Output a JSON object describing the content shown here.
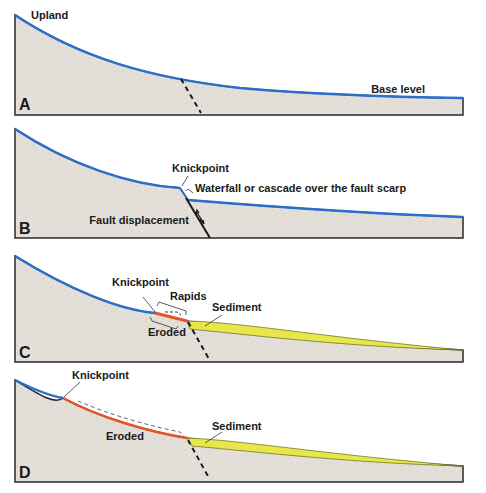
{
  "diagram": {
    "colors": {
      "ground": "#e4dfd9",
      "stream": "#2b6fc9",
      "eroded": "#e2552a",
      "sediment": "#e9e64a",
      "outline": "#2a2a2a"
    },
    "panels": [
      {
        "letter": "A",
        "labels": {
          "upland": "Upland",
          "base_level": "Base level"
        }
      },
      {
        "letter": "B",
        "labels": {
          "knickpoint": "Knickpoint",
          "waterfall": "Waterfall or cascade over the fault scarp",
          "fault_displacement": "Fault displacement"
        }
      },
      {
        "letter": "C",
        "labels": {
          "knickpoint": "Knickpoint",
          "rapids": "Rapids",
          "sediment": "Sediment",
          "eroded": "Eroded"
        }
      },
      {
        "letter": "D",
        "labels": {
          "knickpoint": "Knickpoint",
          "eroded": "Eroded",
          "sediment": "Sediment"
        }
      }
    ]
  }
}
